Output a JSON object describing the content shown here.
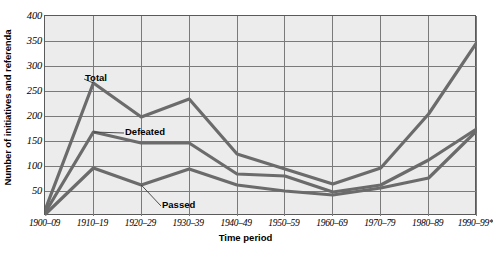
{
  "chart_data": {
    "type": "line",
    "title": "",
    "xlabel": "Time period",
    "ylabel": "Number of initiatives and referenda",
    "categories": [
      "1900–09",
      "1910–19",
      "1920–29",
      "1930–39",
      "1940–49",
      "1950–59",
      "1960–69",
      "1970–79",
      "1980–89",
      "1990–99*"
    ],
    "yticks": [
      0,
      50,
      100,
      150,
      200,
      250,
      300,
      350,
      400
    ],
    "ytick_labels": [
      "",
      "50",
      "100",
      "150",
      "200",
      "250",
      "300",
      "350",
      "400"
    ],
    "ylim": [
      0,
      400
    ],
    "grid": true,
    "legend": "inline-annotations",
    "series": [
      {
        "name": "Total",
        "values": [
          14,
          266,
          198,
          234,
          124,
          94,
          64,
          96,
          204,
          346
        ]
      },
      {
        "name": "Defeated",
        "values": [
          8,
          168,
          146,
          146,
          84,
          80,
          48,
          62,
          112,
          174
        ]
      },
      {
        "name": "Passed",
        "values": [
          4,
          96,
          62,
          94,
          62,
          50,
          42,
          56,
          76,
          170
        ]
      }
    ],
    "annotations": [
      {
        "label": "Total",
        "x": 85,
        "y": 72
      },
      {
        "label": "Defeated",
        "x": 125,
        "y": 126
      },
      {
        "label": "Passed",
        "x": 162,
        "y": 199
      }
    ],
    "colors": {
      "line": "#6b6b6b",
      "plot_background": "#ececec",
      "grid": "#7a7a7a",
      "axis": "#4a4a4a",
      "text": "#000000"
    }
  }
}
